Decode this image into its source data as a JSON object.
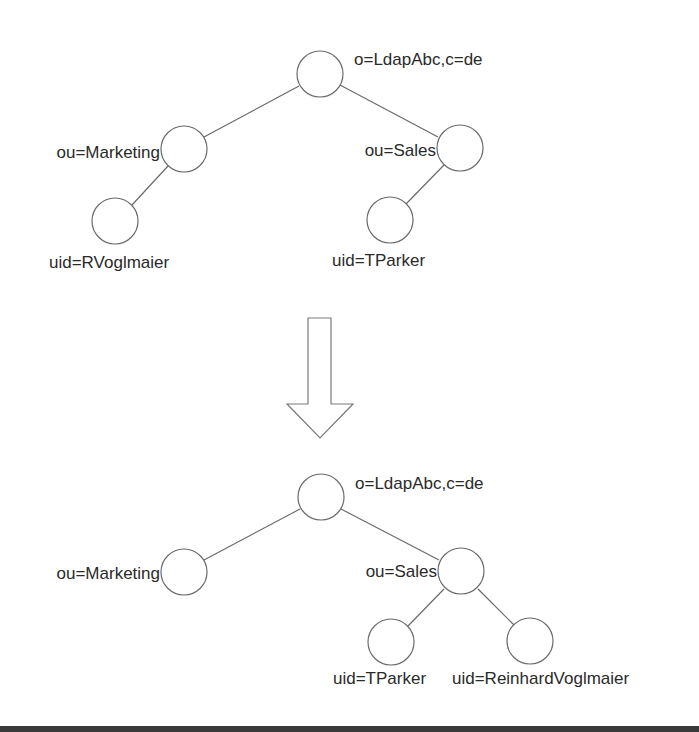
{
  "diagram": {
    "before": {
      "nodes": [
        {
          "id": "root",
          "label": "o=LdapAbc,c=de"
        },
        {
          "id": "marketing",
          "label": "ou=Marketing"
        },
        {
          "id": "sales",
          "label": "ou=Sales"
        },
        {
          "id": "rvoglmaier",
          "label": "uid=RVoglmaier"
        },
        {
          "id": "tparker",
          "label": "uid=TParker"
        }
      ],
      "edges": [
        [
          "root",
          "marketing"
        ],
        [
          "root",
          "sales"
        ],
        [
          "marketing",
          "rvoglmaier"
        ],
        [
          "sales",
          "tparker"
        ]
      ]
    },
    "transition": {
      "icon": "down-arrow-icon"
    },
    "after": {
      "nodes": [
        {
          "id": "root",
          "label": "o=LdapAbc,c=de"
        },
        {
          "id": "marketing",
          "label": "ou=Marketing"
        },
        {
          "id": "sales",
          "label": "ou=Sales"
        },
        {
          "id": "tparker",
          "label": "uid=TParker"
        },
        {
          "id": "reinhardvoglmaier",
          "label": "uid=ReinhardVoglmaier"
        }
      ],
      "edges": [
        [
          "root",
          "marketing"
        ],
        [
          "root",
          "sales"
        ],
        [
          "sales",
          "tparker"
        ],
        [
          "sales",
          "reinhardvoglmaier"
        ]
      ]
    },
    "colors": {
      "stroke": "#6a6a6a",
      "text": "#2a2a2a",
      "background": "#ffffff",
      "bottom_bar": "#3a3a3a"
    }
  }
}
